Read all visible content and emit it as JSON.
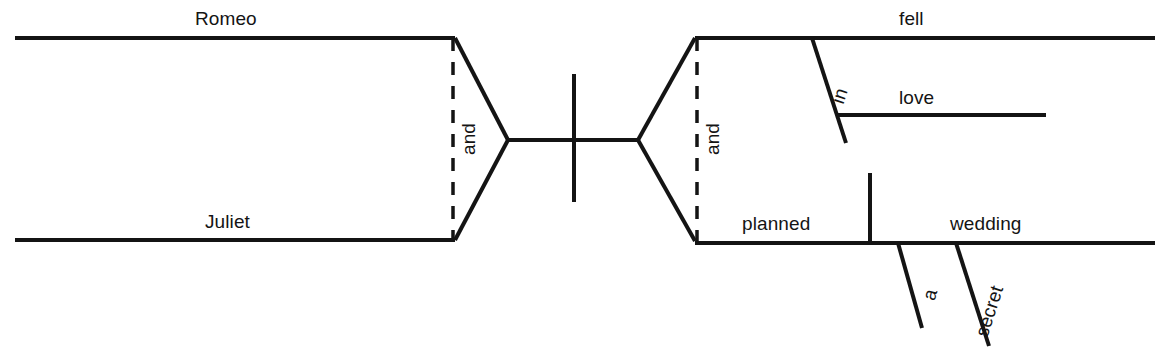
{
  "diagram": {
    "type": "reed-kellogg-sentence-diagram",
    "sentence": "Romeo and Juliet fell in love and planned a secret wedding.",
    "stroke_color": "#141414",
    "background_color": "#ffffff",
    "subject_compound": {
      "conjunction": "and",
      "members": [
        {
          "word": "Romeo",
          "role": "subject"
        },
        {
          "word": "Juliet",
          "role": "subject"
        }
      ]
    },
    "predicate_compound": {
      "conjunction": "and",
      "members": [
        {
          "word": "fell",
          "role": "verb",
          "modifiers": [
            {
              "word": "in",
              "role": "preposition",
              "object": {
                "word": "love",
                "role": "object-of-preposition"
              }
            }
          ]
        },
        {
          "word": "planned",
          "role": "verb",
          "direct_object": {
            "word": "wedding",
            "role": "direct-object",
            "modifiers": [
              {
                "word": "a",
                "role": "article"
              },
              {
                "word": "secret",
                "role": "adjective"
              }
            ]
          }
        }
      ]
    },
    "labels": {
      "romeo": "Romeo",
      "juliet": "Juliet",
      "and_subject": "and",
      "and_predicate": "and",
      "fell": "fell",
      "in": "in",
      "love": "love",
      "planned": "planned",
      "wedding": "wedding",
      "a": "a",
      "secret": "secret"
    }
  }
}
